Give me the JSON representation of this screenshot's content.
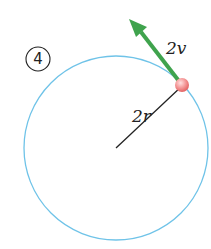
{
  "figure": {
    "panel_number": "4",
    "velocity_label": "2v",
    "radius_label": "2r"
  },
  "colors": {
    "orbit": "#6fc3e8",
    "arrow": "#3fa34d",
    "ball": "#f08a8a",
    "radius_line": "#222222"
  }
}
